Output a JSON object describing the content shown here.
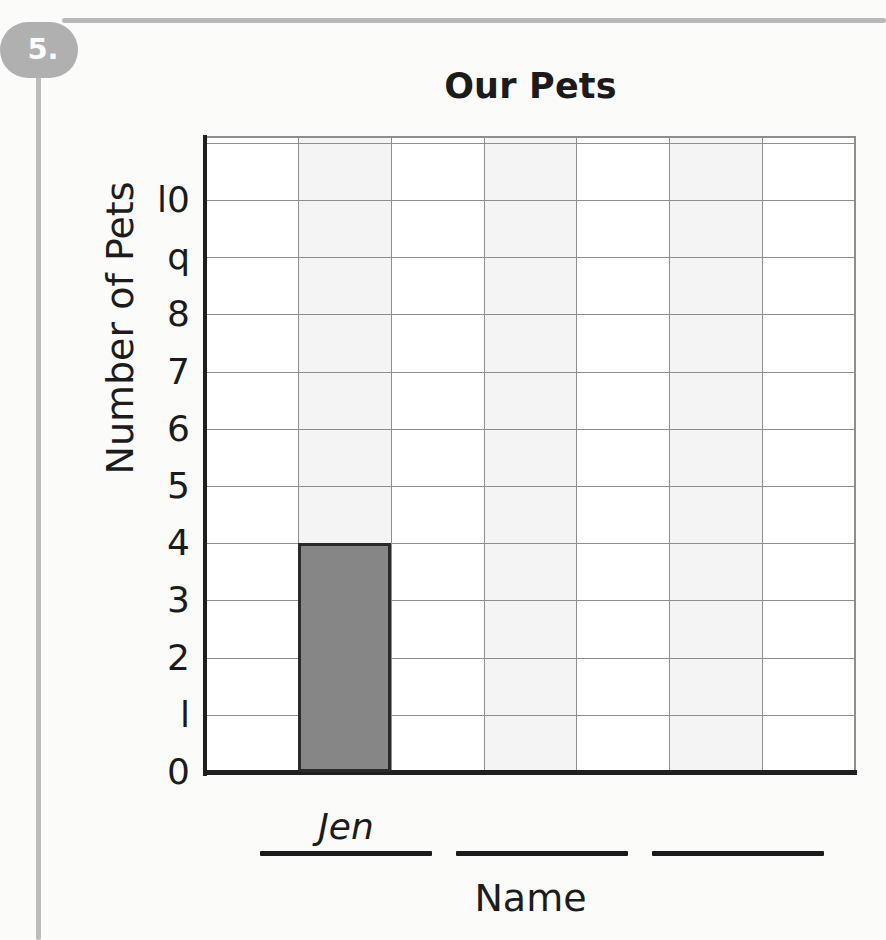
{
  "worksheet": {
    "problem_number": "5.",
    "badge_color": "#b0b0b0",
    "rule_color": "#bcbcbc"
  },
  "chart_data": {
    "type": "bar",
    "title": "Our Pets",
    "xlabel": "Name",
    "ylabel": "Number of Pets",
    "categories": [
      "Jen",
      "",
      ""
    ],
    "values": [
      4,
      null,
      null
    ],
    "ylim": [
      0,
      10
    ],
    "ytick_step": 1,
    "ytick_labels": [
      "0",
      "l",
      "2",
      "3",
      "4",
      "5",
      "6",
      "7",
      "8",
      "q",
      "l0"
    ],
    "ytick_values": [
      0,
      1,
      2,
      3,
      4,
      5,
      6,
      7,
      8,
      9,
      10
    ],
    "grid": true,
    "grid_columns": 7,
    "grid_rows": 11,
    "legend": "none",
    "bar_color": "#868686",
    "bar_outline_color": "#2a2a2a",
    "grid_color": "#8e8e8e",
    "axis_color": "#1f1f1f",
    "band_color": "#f4f4f4",
    "bar_column_index": 1,
    "annotations": []
  },
  "answer_lines": [
    {
      "value": "Jen"
    },
    {
      "value": ""
    },
    {
      "value": ""
    }
  ]
}
